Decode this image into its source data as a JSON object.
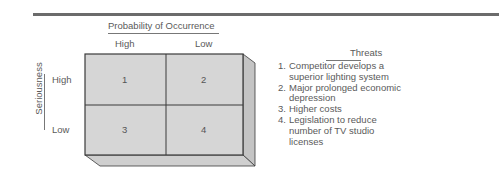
{
  "matrix": {
    "column_axis_title": "Probability of Occurrence",
    "row_axis_title": "Seriousness",
    "columns": [
      "High",
      "Low"
    ],
    "rows": [
      "High",
      "Low"
    ],
    "cells": [
      "1",
      "2",
      "3",
      "4"
    ],
    "colors": {
      "front_face": "#d6d6d6",
      "side_face": "#c4c4c4",
      "bottom_face": "#cfcfcf",
      "border": "#3a3a3a"
    }
  },
  "threats": {
    "title": "Threats",
    "items": [
      {
        "num": "1.",
        "text_lines": [
          "Competitor develops a",
          "superior lighting system"
        ]
      },
      {
        "num": "2.",
        "text_lines": [
          "Major prolonged economic",
          "depression"
        ]
      },
      {
        "num": "3.",
        "text_lines": [
          "Higher costs"
        ]
      },
      {
        "num": "4.",
        "text_lines": [
          "Legislation to reduce",
          "number of TV studio",
          "licenses"
        ]
      }
    ]
  }
}
